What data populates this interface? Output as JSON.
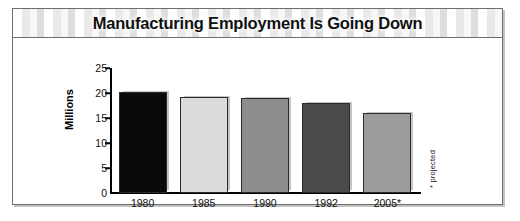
{
  "figure": {
    "title": "Manufacturing Employment Is Going Down",
    "footnote": "* projected"
  },
  "chart_data": {
    "type": "bar",
    "title": "Manufacturing Employment Is Going Down",
    "xlabel": "",
    "ylabel": "Millions",
    "categories": [
      "1980",
      "1985",
      "1990",
      "1992",
      "2005*"
    ],
    "values": [
      20.3,
      19.3,
      19.1,
      18.0,
      16.1
    ],
    "ylim": [
      0,
      25
    ],
    "yticks": [
      0,
      5,
      10,
      15,
      20,
      25
    ],
    "ytick_labels": [
      "0",
      "5",
      "10",
      "15",
      "20",
      "25"
    ],
    "grid": false,
    "legend": null,
    "annotations": [
      "* projected"
    ],
    "bar_colors": [
      "#0a0a0a",
      "#dcdcdc",
      "#8d8d8d",
      "#4a4a4a",
      "#9b9b9b"
    ]
  }
}
